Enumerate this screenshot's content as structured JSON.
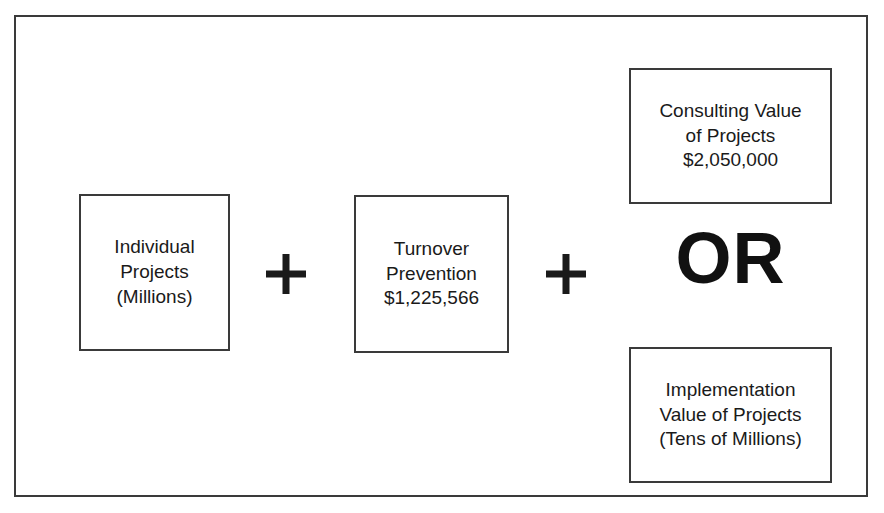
{
  "figure": {
    "nodes": {
      "individual_projects": {
        "lines": [
          "Individual",
          "Projects",
          "(Millions)"
        ]
      },
      "turnover_prevention": {
        "lines": [
          "Turnover",
          "Prevention",
          "$1,225,566"
        ]
      },
      "consulting_value": {
        "lines": [
          "Consulting Value",
          "of Projects",
          "$2,050,000"
        ]
      },
      "implementation_value": {
        "lines": [
          "Implementation",
          "Value of Projects",
          "(Tens of Millions)"
        ]
      }
    },
    "operators": {
      "plus_1": "+",
      "plus_2": "+",
      "or_label": "OR"
    },
    "colors": {
      "stroke": "#3a3a3a",
      "text": "#1a1a1a",
      "background": "#ffffff"
    }
  }
}
